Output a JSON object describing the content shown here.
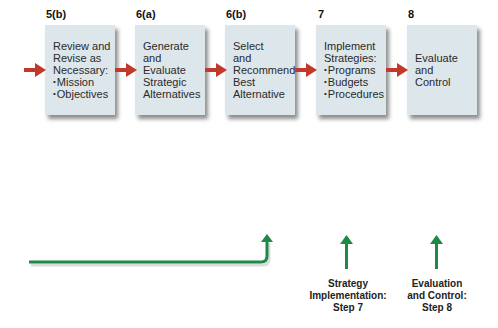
{
  "steps": [
    {
      "number": "5(b)",
      "lines": [
        "Review and",
        "Revise as",
        "Necessary:"
      ],
      "bullets": [
        "Mission",
        "Objectives"
      ]
    },
    {
      "number": "6(a)",
      "lines": [
        "Generate",
        "and",
        "Evaluate",
        "Strategic",
        "Alternatives"
      ],
      "bullets": []
    },
    {
      "number": "6(b)",
      "lines": [
        "Select",
        "and",
        "Recommend",
        "Best",
        "Alternative"
      ],
      "bullets": []
    },
    {
      "number": "7",
      "lines": [
        "Implement",
        "Strategies:"
      ],
      "bullets": [
        "Programs",
        "Budgets",
        "Procedures"
      ]
    },
    {
      "number": "8",
      "lines": [
        "Evaluate",
        "and",
        "Control"
      ],
      "bullets": []
    }
  ],
  "feedback_labels": [
    {
      "lines": [
        "Strategy",
        "Implementation:",
        "Step 7"
      ]
    },
    {
      "lines": [
        "Evaluation",
        "and Control:",
        "Step 8"
      ]
    }
  ],
  "colors": {
    "box_fill": "#dde6ea",
    "flow_arrow": "#c0392b",
    "feedback_arrow": "#1e8a4a"
  }
}
